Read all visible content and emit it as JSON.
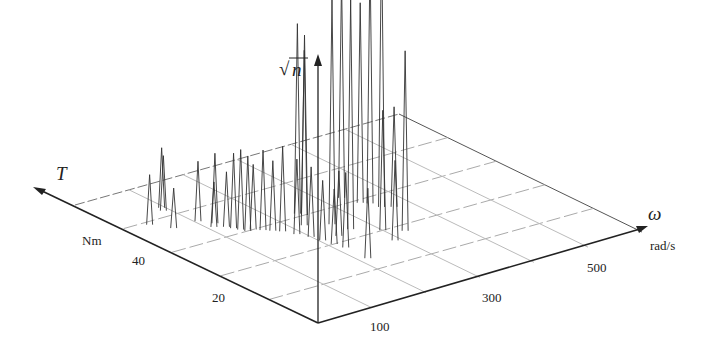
{
  "chart_data": {
    "type": "3d-spike",
    "title": "",
    "axes": {
      "z": {
        "label": "√n",
        "label_sqrt": "√",
        "label_var": "n"
      },
      "t": {
        "label": "T",
        "unit": "Nm",
        "ticks": [
          "20",
          "40"
        ]
      },
      "w": {
        "label": "ω",
        "unit": "rad/s",
        "ticks": [
          "100",
          "300",
          "500"
        ]
      }
    },
    "grid": true,
    "note": "Spike heights (in px of the vertical axis projection) approximate √n of operating-point counts at (T, ω).",
    "spikes": [
      {
        "t": 43,
        "w": 40,
        "h": 50
      },
      {
        "t": 40,
        "w": 60,
        "h": 40
      },
      {
        "t": 46,
        "w": 90,
        "h": 55
      },
      {
        "t": 47,
        "w": 95,
        "h": 60
      },
      {
        "t": 40,
        "w": 105,
        "h": 60
      },
      {
        "t": 37,
        "w": 110,
        "h": 45
      },
      {
        "t": 38,
        "w": 120,
        "h": 70
      },
      {
        "t": 36,
        "w": 125,
        "h": 55
      },
      {
        "t": 35,
        "w": 130,
        "h": 75
      },
      {
        "t": 34,
        "w": 135,
        "h": 80
      },
      {
        "t": 33,
        "w": 140,
        "h": 75
      },
      {
        "t": 33,
        "w": 150,
        "h": 65
      },
      {
        "t": 32,
        "w": 160,
        "h": 80
      },
      {
        "t": 31,
        "w": 170,
        "h": 70
      },
      {
        "t": 30,
        "w": 180,
        "h": 85
      },
      {
        "t": 28,
        "w": 190,
        "h": 75
      },
      {
        "t": 26,
        "w": 200,
        "h": 70
      },
      {
        "t": 24,
        "w": 205,
        "h": 60
      },
      {
        "t": 22,
        "w": 210,
        "h": 55
      },
      {
        "t": 20,
        "w": 215,
        "h": 75
      },
      {
        "t": 30,
        "w": 220,
        "h": 175
      },
      {
        "t": 34,
        "w": 240,
        "h": 190
      },
      {
        "t": 33,
        "w": 245,
        "h": 180
      },
      {
        "t": 24,
        "w": 235,
        "h": 65
      },
      {
        "t": 28,
        "w": 255,
        "h": 225
      },
      {
        "t": 25,
        "w": 265,
        "h": 230
      },
      {
        "t": 15,
        "w": 215,
        "h": 70
      },
      {
        "t": 35,
        "w": 330,
        "h": 220
      },
      {
        "t": 32,
        "w": 340,
        "h": 200
      },
      {
        "t": 31,
        "w": 350,
        "h": 245
      },
      {
        "t": 29,
        "w": 355,
        "h": 275
      },
      {
        "t": 28,
        "w": 370,
        "h": 100
      },
      {
        "t": 20,
        "w": 325,
        "h": 180
      },
      {
        "t": 22,
        "w": 300,
        "h": 120
      },
      {
        "t": 18,
        "w": 290,
        "h": 80
      }
    ]
  }
}
